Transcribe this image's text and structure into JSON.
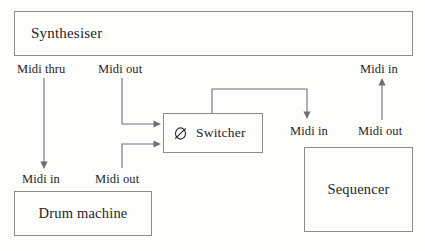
{
  "diagram": {
    "type": "block-diagram",
    "devices": [
      {
        "id": "synthesiser",
        "label": "Synthesiser"
      },
      {
        "id": "switcher",
        "label": "Switcher",
        "icon": "phi-slashed-circle-icon"
      },
      {
        "id": "drum_machine",
        "label": "Drum machine"
      },
      {
        "id": "sequencer",
        "label": "Sequencer"
      }
    ],
    "ports": {
      "synth_thru": "Midi thru",
      "synth_out": "Midi out",
      "synth_in": "Midi in",
      "switcher_in": "Midi in",
      "sequencer_out": "Midi out",
      "drum_in": "Midi in",
      "drum_out": "Midi out"
    },
    "connections": [
      {
        "from": "synthesiser.Midi thru",
        "to": "drum_machine.Midi in"
      },
      {
        "from": "synthesiser.Midi out",
        "to": "switcher"
      },
      {
        "from": "drum_machine.Midi out",
        "to": "switcher"
      },
      {
        "from": "switcher",
        "to": "sequencer.Midi in"
      },
      {
        "from": "sequencer.Midi out",
        "to": "synthesiser.Midi in"
      }
    ],
    "colors": {
      "box_border": "#8c8c8c",
      "connector": "#6f7073",
      "text": "#25262a",
      "background": "#fdfdfc"
    }
  }
}
